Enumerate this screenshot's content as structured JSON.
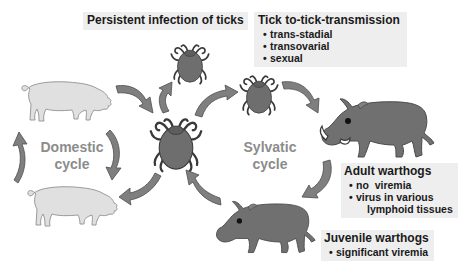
{
  "labels": {
    "persistent": {
      "title": "Persistent infection of ticks"
    },
    "tick_transmission": {
      "title": "Tick to-tick-transmission",
      "items": [
        "trans-stadial",
        "transovarial",
        "sexual"
      ]
    },
    "adult_warthogs": {
      "title": "Adult warthogs",
      "items": [
        "no  viremia",
        "virus in various",
        "lymphoid tissues"
      ]
    },
    "juvenile_warthogs": {
      "title": "Juvenile warthogs",
      "items": [
        "significant viremia"
      ]
    }
  },
  "cycles": {
    "domestic": {
      "line1": "Domestic",
      "line2": "cycle"
    },
    "sylvatic": {
      "line1": "Sylvatic",
      "line2": "cycle"
    }
  },
  "bullet": "•",
  "colors": {
    "background": "#ffffff",
    "label_box": "#eeeeee",
    "text": "#1a1a1a",
    "cycle_text": "#8c8c8c",
    "arrow_fill": "#7f7f7f",
    "arrow_stroke": "#4d4d4d",
    "tick_fill": "#6e6e6e",
    "warthog_fill": "#707070",
    "pig_fill": "#e0e0e0",
    "pig_stroke": "#9a9a9a"
  },
  "nodes": [
    "domestic-pig-top",
    "domestic-pig-bottom",
    "tick-central",
    "tick-top",
    "tick-right",
    "adult-warthog",
    "juvenile-warthog"
  ]
}
